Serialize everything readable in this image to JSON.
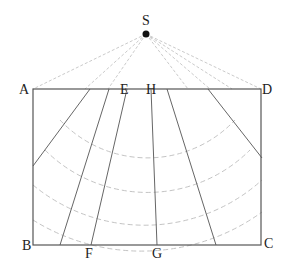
{
  "diagram": {
    "title": "",
    "points": {
      "S": {
        "label": "S",
        "x": 146,
        "y": 34
      },
      "A": {
        "label": "A",
        "x": 33,
        "y": 89
      },
      "D": {
        "label": "D",
        "x": 261,
        "y": 89
      },
      "B": {
        "label": "B",
        "x": 33,
        "y": 245
      },
      "C": {
        "label": "C",
        "x": 262,
        "y": 244
      },
      "E": {
        "label": "E",
        "x": 127,
        "y": 89
      },
      "H": {
        "label": "H",
        "x": 152,
        "y": 89
      },
      "F": {
        "label": "F",
        "x": 91,
        "y": 245
      },
      "G": {
        "label": "G",
        "x": 157,
        "y": 245
      }
    },
    "labels": {
      "S": "S",
      "A": "A",
      "B": "B",
      "C": "C",
      "D": "D",
      "E": "E",
      "F": "F",
      "G": "G",
      "H": "H"
    },
    "colors": {
      "line": "#555555",
      "dashed": "#bbbbbb",
      "point": "#111111"
    }
  }
}
